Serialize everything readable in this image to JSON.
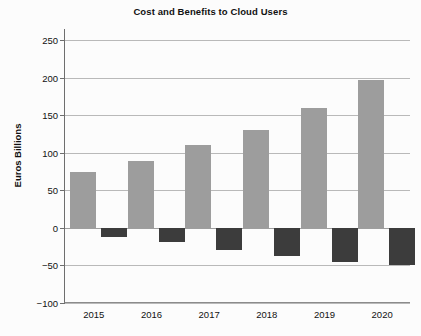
{
  "chart_data": {
    "type": "bar",
    "title": "Cost and Benefits to Cloud Users",
    "xlabel": "",
    "ylabel": "Euros Billions",
    "categories": [
      "2015",
      "2016",
      "2017",
      "2018",
      "2019",
      "2020"
    ],
    "ylim": [
      -100,
      265
    ],
    "yticks": [
      250,
      200,
      150,
      100,
      50,
      0,
      -50,
      -100
    ],
    "ytick_labels": [
      "250",
      "200",
      "150",
      "100",
      "50",
      "0",
      "−50",
      "−100"
    ],
    "grid": true,
    "legend": "none",
    "series": [
      {
        "name": "Benefits",
        "color": "#9d9d9d",
        "values": [
          75,
          89,
          110,
          131,
          160,
          197
        ]
      },
      {
        "name": "Costs",
        "color": "#3c3c3c",
        "values": [
          -12,
          -19,
          -30,
          -38,
          -46,
          -50
        ]
      }
    ]
  }
}
